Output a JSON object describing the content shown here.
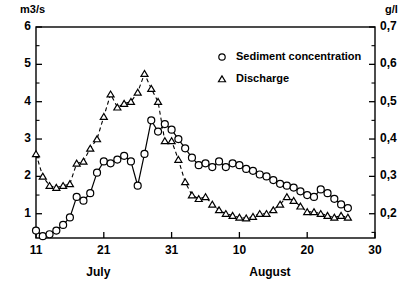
{
  "chart_data": {
    "type": "line",
    "title": "",
    "xlabel": "",
    "grid": false,
    "legend_position": "top-right",
    "x_axis": {
      "label": "",
      "tick_labels": [
        "11",
        "21",
        "31",
        "10",
        "20",
        "30"
      ],
      "tick_values": [
        11,
        21,
        31,
        41,
        51,
        61
      ],
      "range": [
        11,
        61
      ],
      "month_labels": [
        "July",
        "August"
      ]
    },
    "y_axis_left": {
      "unit": "m3/s",
      "tick_labels": [
        "1",
        "2",
        "3",
        "4",
        "5",
        "6"
      ],
      "tick_values": [
        1,
        2,
        3,
        4,
        5,
        6
      ],
      "range": [
        0.35,
        6
      ],
      "minor_ticks": [
        1.5,
        2.5,
        3.5,
        4.5,
        5.5
      ]
    },
    "y_axis_right": {
      "unit": "g/l",
      "tick_labels": [
        "0,2",
        "0,3",
        "0,4",
        "0,5",
        "0,6",
        "0,7"
      ],
      "tick_values": [
        0.2,
        0.3,
        0.4,
        0.5,
        0.6,
        0.7
      ],
      "range": [
        0.135,
        0.7
      ],
      "minor_ticks": [
        0.25,
        0.35,
        0.45,
        0.55,
        0.65
      ]
    },
    "series": [
      {
        "name": "Sediment concentration",
        "axis": "right",
        "unit": "g/l",
        "marker": "circle",
        "line_style": "solid",
        "x": [
          11,
          12,
          13,
          14,
          15,
          16,
          17,
          18,
          19,
          20,
          21,
          22,
          23,
          24,
          25,
          26,
          27,
          28,
          29,
          30,
          31,
          32,
          33,
          34,
          35,
          36,
          37,
          38,
          39,
          40,
          41,
          42,
          43,
          44,
          45,
          46,
          47,
          48,
          49,
          50,
          51,
          52,
          53,
          54,
          55,
          56,
          57
        ],
        "values": [
          0.155,
          0.14,
          0.145,
          0.155,
          0.17,
          0.19,
          0.245,
          0.235,
          0.255,
          0.31,
          0.34,
          0.335,
          0.345,
          0.355,
          0.34,
          0.275,
          0.36,
          0.45,
          0.42,
          0.44,
          0.425,
          0.4,
          0.375,
          0.35,
          0.33,
          0.335,
          0.325,
          0.34,
          0.325,
          0.335,
          0.33,
          0.32,
          0.315,
          0.305,
          0.3,
          0.29,
          0.28,
          0.275,
          0.27,
          0.26,
          0.25,
          0.245,
          0.265,
          0.255,
          0.24,
          0.225,
          0.215
        ]
      },
      {
        "name": "Discharge",
        "axis": "left",
        "unit": "m3/s",
        "marker": "triangle",
        "line_style": "dashed",
        "x": [
          11,
          12,
          13,
          14,
          15,
          16,
          17,
          18,
          19,
          20,
          21,
          22,
          23,
          24,
          25,
          26,
          27,
          28,
          29,
          30,
          31,
          32,
          33,
          34,
          35,
          36,
          37,
          38,
          39,
          40,
          41,
          42,
          43,
          44,
          45,
          46,
          47,
          48,
          49,
          50,
          51,
          52,
          53,
          54,
          55,
          56,
          57
        ],
        "values": [
          2.6,
          2.0,
          1.75,
          1.7,
          1.75,
          1.8,
          2.35,
          2.4,
          2.75,
          3.0,
          3.6,
          4.2,
          3.85,
          3.95,
          4.0,
          4.25,
          4.75,
          4.35,
          4.0,
          2.95,
          2.95,
          2.45,
          1.85,
          1.5,
          1.4,
          1.45,
          1.25,
          1.1,
          1.0,
          0.95,
          0.9,
          0.88,
          0.92,
          1.0,
          1.0,
          1.1,
          1.25,
          1.45,
          1.35,
          1.2,
          1.05,
          1.05,
          1.0,
          0.95,
          0.9,
          0.95,
          0.9
        ]
      }
    ]
  },
  "legend": {
    "entries": [
      {
        "label": "Sediment concentration",
        "marker": "circle"
      },
      {
        "label": "Discharge",
        "marker": "triangle"
      }
    ]
  }
}
